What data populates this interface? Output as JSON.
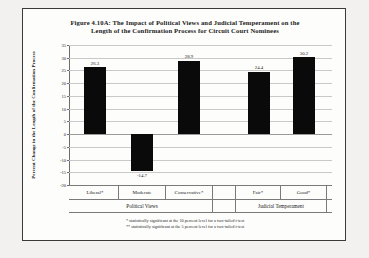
{
  "figure": {
    "title_line1": "Figure 4.10A: The Impact of Political Views and Judicial Temperament on the",
    "title_line2": "Length of the Confirmation Process for Circuit Court Nominees",
    "footnote1": "* statistically significant at the 10 percent level for a two-tailed t-test",
    "footnote2": "** statistically significant at the 5 percent level for a two-tailed t-test",
    "bar_color": "#0a0a0a",
    "grid_color": "#c9c9c9",
    "frame_color": "#3a3a3a",
    "background": "#fdfdfc"
  },
  "chart_data": {
    "type": "bar",
    "title": "Figure 4.10A: The Impact of Political Views and Judicial Temperament on the Length of the Confirmation Process for Circuit Court Nominees",
    "xlabel": "",
    "ylabel": "Percent Change in the Length of the Confirmation Process",
    "categories": [
      "Liberal*",
      "Moderate",
      "Conservative*",
      "Fair*",
      "Good*"
    ],
    "values": [
      26.3,
      -14.7,
      28.9,
      24.4,
      30.2
    ],
    "data_labels": [
      "26.3",
      "-14.7",
      "28.9",
      "24.4",
      "30.2"
    ],
    "groups": [
      {
        "label": "Political Views",
        "categories": [
          "Liberal*",
          "Moderate",
          "Conservative*"
        ]
      },
      {
        "label": "Judicial Temperament",
        "categories": [
          "Fair*",
          "Good*"
        ]
      }
    ],
    "ylim": [
      -20,
      35
    ],
    "yticks": [
      35,
      30,
      25,
      20,
      15,
      10,
      5,
      0,
      -5,
      -10,
      -15,
      -20
    ],
    "ytick_labels": [
      "35",
      "30",
      "25",
      "20",
      "15",
      "10",
      "5",
      "0",
      "-5",
      "-10",
      "-15",
      "-20"
    ],
    "grid": true,
    "legend": "none",
    "series_color": "#0a0a0a"
  }
}
